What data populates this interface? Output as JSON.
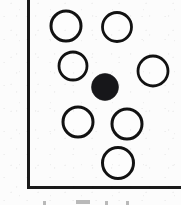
{
  "figure": {
    "kind": "coordination-polyhedron-scan",
    "title": "",
    "width": 181,
    "height": 205,
    "background_color": "#fcfcfc",
    "ink_color": "#121212",
    "filled_atom_color": "#17171a",
    "open_atom_fill": "#fdfdfd"
  },
  "frame": {
    "name": "axis-frame",
    "style": "L-shaped",
    "stroke_width": 3,
    "vertical_axis": {
      "x": 28,
      "y_top": 0,
      "y_bottom": 188
    },
    "horizontal_axis": {
      "y": 187,
      "x_left": 28,
      "x_right": 181
    },
    "clipped_edges": [
      "top",
      "right"
    ]
  },
  "legend": {
    "open_circle_label": "open circle",
    "filled_circle_label": "filled circle"
  },
  "chart_data": {
    "type": "scatter",
    "title": "",
    "xlabel": "",
    "ylabel": "",
    "grid": false,
    "legend_position": "none",
    "xlim": [
      0,
      181
    ],
    "ylim": [
      205,
      0
    ],
    "series": [
      {
        "name": "ligand-atoms",
        "marker": "open-circle",
        "fill": "#fdfdfd",
        "stroke": "#121212",
        "points": [
          {
            "id": "atom-1",
            "cx": 66,
            "cy": 26,
            "r": 15,
            "stroke_width": 3.0
          },
          {
            "id": "atom-2",
            "cx": 117,
            "cy": 27,
            "r": 14.5,
            "stroke_width": 2.8
          },
          {
            "id": "atom-3",
            "cx": 73,
            "cy": 66,
            "r": 14.0,
            "stroke_width": 2.8
          },
          {
            "id": "atom-4",
            "cx": 153,
            "cy": 71,
            "r": 15.0,
            "stroke_width": 2.8
          },
          {
            "id": "atom-5",
            "cx": 78,
            "cy": 122,
            "r": 15.0,
            "stroke_width": 3.0
          },
          {
            "id": "atom-6",
            "cx": 127,
            "cy": 124,
            "r": 15.0,
            "stroke_width": 3.0
          },
          {
            "id": "atom-7",
            "cx": 118,
            "cy": 163,
            "r": 15.5,
            "stroke_width": 3.0
          }
        ]
      },
      {
        "name": "central-atom",
        "marker": "filled-circle",
        "fill": "#17171a",
        "stroke": "#17171a",
        "points": [
          {
            "id": "atom-center",
            "cx": 105,
            "cy": 87,
            "r": 13.5
          }
        ]
      }
    ],
    "counts": {
      "open_circles": 7,
      "filled_circles": 1,
      "total_atoms": 8
    }
  },
  "caption": {
    "text": "",
    "note": "clipped-glyph-tops",
    "marks": [
      {
        "id": "mark-1",
        "x": 43,
        "y": 201,
        "width": 3,
        "height": 4
      },
      {
        "id": "mark-2",
        "x": 76,
        "y": 200,
        "width": 14,
        "height": 4
      },
      {
        "id": "mark-3",
        "x": 105,
        "y": 201,
        "width": 3,
        "height": 4
      },
      {
        "id": "mark-4",
        "x": 126,
        "y": 201,
        "width": 3,
        "height": 4
      }
    ]
  }
}
